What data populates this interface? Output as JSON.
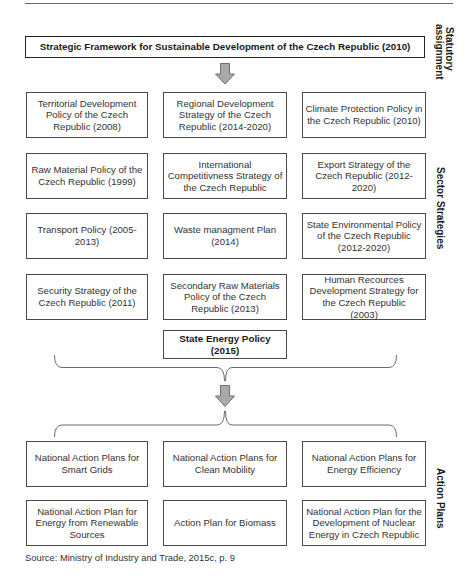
{
  "framework": {
    "title": "Strategic Framework for Sustainable Development of the Czech Republic (2010)"
  },
  "side_labels": {
    "statutory": "Statutory\nassignment",
    "sector": "Sector Strategies",
    "action": "Action Plans"
  },
  "sector_strategies": [
    [
      "Territorial Development Policy of the Czech Republic (2008)",
      "Regional Development Strategy of the Czech Republic (2014-2020)",
      "Climate Protection Policy in the Czech Republic (2010)"
    ],
    [
      "Raw Material Policy of the Czech Republic (1999)",
      "International Competitivness Strategy of the Czech Republic",
      "Export Strategy of the Czech Republic (2012-2020)"
    ],
    [
      "Transport Policy (2005-2013)",
      "Waste managment Plan (2014)",
      "State Environmental Policy of the Czech Republic (2012-2020)"
    ],
    [
      "Security Strategy of the Czech Republic (2011)",
      "Secondary Raw Materials Policy of the Czech Republic (2013)",
      "Human Recources Development Strategy for the Czech Republic (2003)"
    ]
  ],
  "energy_policy": {
    "title": "State Energy Policy (2015)"
  },
  "action_plans": [
    [
      "National Action Plans for Smart Grids",
      "National Action Plans for Clean Mobility",
      "National Action Plans for Energy Efficiency"
    ],
    [
      "National Action Plan for Energy from Renewable Sources",
      "Action Plan for Biomass",
      "National Action Plan for the Development of Nuclear Energy in Czech Republic"
    ]
  ],
  "source": "Source: Ministry of Industry and Trade, 2015c, p. 9",
  "colors": {
    "arrow_fill": "#a9a9a9",
    "arrow_stroke": "#6e6e6e",
    "box_border": "#4a4a4a",
    "brace": "#5a5a5a"
  }
}
